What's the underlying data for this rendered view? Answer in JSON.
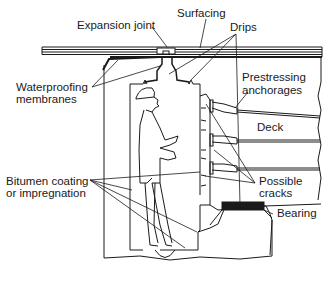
{
  "diagram": {
    "labels": {
      "surfacing": "Surfacing",
      "expansion_joint": "Expansion joint",
      "drips": "Drips",
      "waterproofing_1": "Waterproofing",
      "waterproofing_2": "membranes",
      "prestressing_1": "Prestressing",
      "prestressing_2": "anchorages",
      "deck": "Deck",
      "bitumen_1": "Bitumen coating",
      "bitumen_2": "or impregnation",
      "cracks_1": "Possible",
      "cracks_2": "cracks",
      "bearing": "Bearing"
    },
    "colors": {
      "line": "#1a1a1a",
      "background": "#ffffff",
      "bearing_fill": "#1a1a1a"
    }
  }
}
